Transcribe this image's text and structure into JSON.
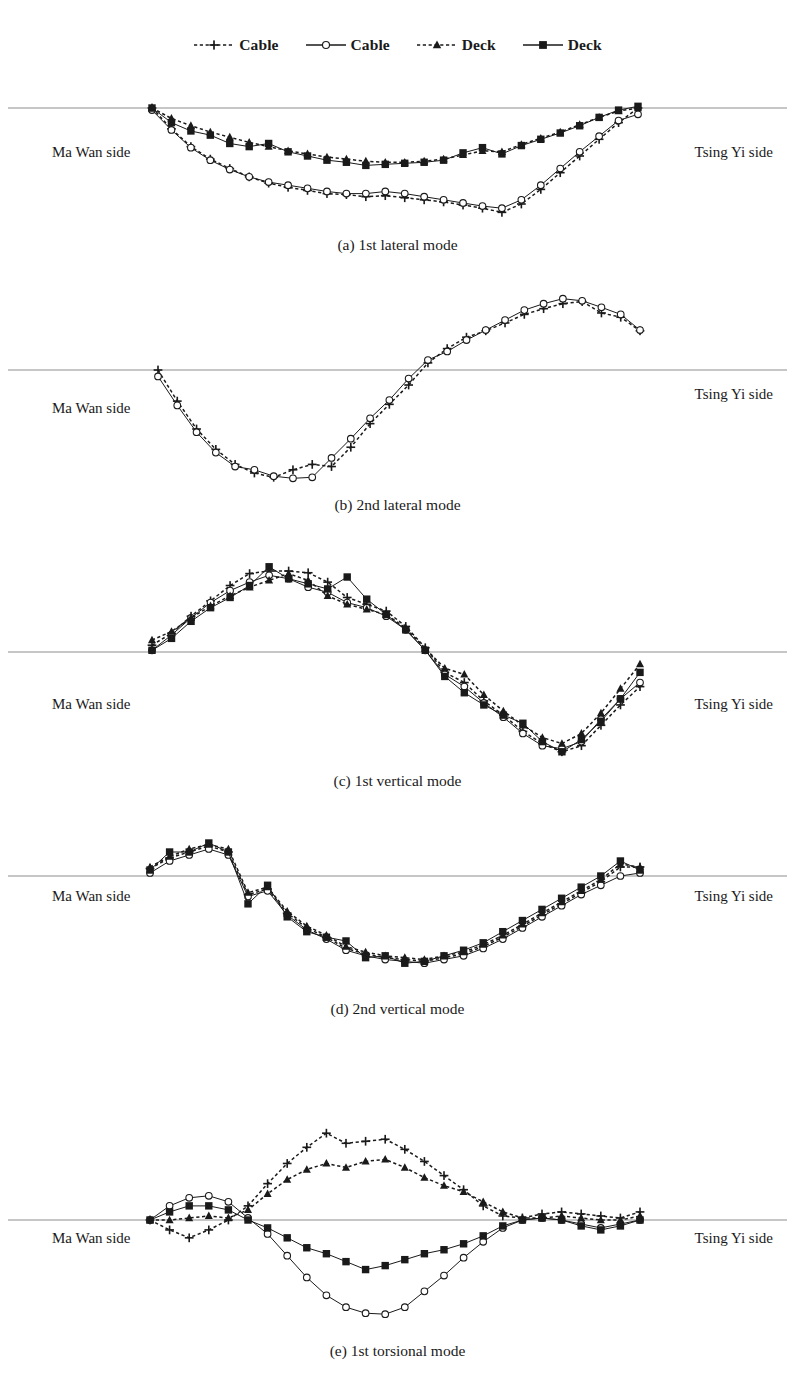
{
  "figure": {
    "side_label_left": "Ma Wan side",
    "side_label_right": "Tsing Yi side"
  },
  "legend": {
    "position": "top-center",
    "entries": [
      {
        "label": "Cable",
        "marker": "plus-icon",
        "line": "dotted",
        "color": "#1a1a1a"
      },
      {
        "label": "Cable",
        "marker": "circle-icon",
        "line": "solid",
        "color": "#1a1a1a"
      },
      {
        "label": "Deck",
        "marker": "triangle-icon",
        "line": "dotted",
        "color": "#1a1a1a"
      },
      {
        "label": "Deck",
        "marker": "square-icon",
        "line": "solid",
        "color": "#1a1a1a"
      }
    ]
  },
  "chart_data": [
    {
      "type": "line",
      "id": "a",
      "title": "(a) 1st lateral mode",
      "xlabel": "",
      "ylabel": "",
      "grid": false,
      "zero_axis": true,
      "xlim": [
        0,
        1
      ],
      "ylim": [
        -1.15,
        0.12
      ],
      "x": [
        0.0,
        0.04,
        0.08,
        0.12,
        0.16,
        0.2,
        0.24,
        0.28,
        0.32,
        0.36,
        0.4,
        0.44,
        0.48,
        0.52,
        0.56,
        0.6,
        0.64,
        0.68,
        0.72,
        0.76,
        0.8,
        0.84,
        0.88,
        0.92,
        0.96,
        1.0
      ],
      "series": [
        {
          "name": "Cable",
          "marker": "plus-icon",
          "line": "dotted",
          "values": [
            0.0,
            -0.2,
            -0.37,
            -0.49,
            -0.58,
            -0.66,
            -0.72,
            -0.76,
            -0.79,
            -0.82,
            -0.83,
            -0.85,
            -0.84,
            -0.86,
            -0.88,
            -0.9,
            -0.93,
            -0.96,
            -1.0,
            -0.92,
            -0.78,
            -0.62,
            -0.46,
            -0.3,
            -0.14,
            0.0
          ]
        },
        {
          "name": "Cable",
          "marker": "circle-icon",
          "line": "solid",
          "values": [
            -0.02,
            -0.21,
            -0.38,
            -0.5,
            -0.59,
            -0.66,
            -0.71,
            -0.74,
            -0.77,
            -0.8,
            -0.82,
            -0.82,
            -0.8,
            -0.82,
            -0.85,
            -0.88,
            -0.91,
            -0.94,
            -0.96,
            -0.88,
            -0.74,
            -0.58,
            -0.42,
            -0.27,
            -0.12,
            -0.06
          ]
        },
        {
          "name": "Deck",
          "marker": "triangle-icon",
          "line": "dotted",
          "values": [
            0.0,
            -0.1,
            -0.17,
            -0.23,
            -0.28,
            -0.33,
            -0.37,
            -0.41,
            -0.44,
            -0.47,
            -0.49,
            -0.51,
            -0.52,
            -0.52,
            -0.51,
            -0.49,
            -0.45,
            -0.41,
            -0.42,
            -0.35,
            -0.29,
            -0.23,
            -0.16,
            -0.09,
            -0.03,
            0.0
          ]
        },
        {
          "name": "Deck",
          "marker": "square-icon",
          "line": "solid",
          "values": [
            0.0,
            -0.14,
            -0.22,
            -0.26,
            -0.34,
            -0.37,
            -0.34,
            -0.42,
            -0.46,
            -0.5,
            -0.52,
            -0.55,
            -0.54,
            -0.53,
            -0.52,
            -0.5,
            -0.43,
            -0.38,
            -0.44,
            -0.36,
            -0.3,
            -0.24,
            -0.17,
            -0.09,
            -0.02,
            0.02
          ]
        }
      ]
    },
    {
      "type": "line",
      "id": "b",
      "title": "(b) 2nd lateral mode",
      "xlabel": "",
      "ylabel": "",
      "grid": false,
      "zero_axis": true,
      "xlim": [
        0,
        1
      ],
      "ylim": [
        -1.1,
        1.15
      ],
      "x": [
        0.0,
        0.04,
        0.08,
        0.12,
        0.16,
        0.2,
        0.24,
        0.28,
        0.32,
        0.36,
        0.4,
        0.44,
        0.48,
        0.52,
        0.56,
        0.6,
        0.64,
        0.68,
        0.72,
        0.76,
        0.8,
        0.84,
        0.88,
        0.92,
        0.96,
        1.0
      ],
      "series": [
        {
          "name": "Cable",
          "marker": "plus-icon",
          "line": "dotted",
          "values": [
            0.0,
            -0.29,
            -0.55,
            -0.74,
            -0.88,
            -0.96,
            -1.0,
            -0.93,
            -0.88,
            -0.9,
            -0.72,
            -0.5,
            -0.32,
            -0.14,
            0.1,
            0.3,
            0.46,
            0.55,
            0.66,
            0.78,
            0.86,
            0.93,
            0.96,
            0.8,
            0.74,
            0.55
          ]
        },
        {
          "name": "Cable",
          "marker": "circle-icon",
          "line": "solid",
          "values": [
            -0.06,
            -0.33,
            -0.58,
            -0.77,
            -0.9,
            -0.93,
            -0.99,
            -1.01,
            -1.0,
            -0.82,
            -0.64,
            -0.45,
            -0.28,
            -0.08,
            0.14,
            0.26,
            0.42,
            0.56,
            0.7,
            0.84,
            0.93,
            1.0,
            0.97,
            0.88,
            0.78,
            0.56
          ]
        }
      ]
    },
    {
      "type": "line",
      "id": "c",
      "title": "(c) 1st vertical mode",
      "xlabel": "",
      "ylabel": "",
      "grid": false,
      "zero_axis": true,
      "xlim": [
        0,
        1
      ],
      "ylim": [
        -1.1,
        1.15
      ],
      "x": [
        0.0,
        0.04,
        0.08,
        0.12,
        0.16,
        0.2,
        0.24,
        0.28,
        0.32,
        0.36,
        0.4,
        0.44,
        0.48,
        0.52,
        0.56,
        0.6,
        0.64,
        0.68,
        0.72,
        0.76,
        0.8,
        0.84,
        0.88,
        0.92,
        0.96,
        1.0
      ],
      "series": [
        {
          "name": "Cable",
          "marker": "plus-icon",
          "line": "dotted",
          "values": [
            0.08,
            0.22,
            0.42,
            0.6,
            0.78,
            0.92,
            0.95,
            0.95,
            0.93,
            0.82,
            0.64,
            0.56,
            0.48,
            0.3,
            0.05,
            -0.2,
            -0.3,
            -0.48,
            -0.62,
            -0.78,
            -0.9,
            -0.98,
            -0.92,
            -0.72,
            -0.52,
            -0.34
          ]
        },
        {
          "name": "Cable",
          "marker": "circle-icon",
          "line": "solid",
          "values": [
            0.02,
            0.2,
            0.4,
            0.58,
            0.72,
            0.82,
            0.9,
            0.86,
            0.76,
            0.7,
            0.58,
            0.52,
            0.42,
            0.26,
            0.02,
            -0.22,
            -0.34,
            -0.5,
            -0.64,
            -0.8,
            -0.92,
            -0.95,
            -0.88,
            -0.66,
            -0.46,
            -0.3
          ]
        },
        {
          "name": "Deck",
          "marker": "triangle-icon",
          "line": "dotted",
          "values": [
            0.14,
            0.24,
            0.4,
            0.54,
            0.66,
            0.76,
            0.84,
            0.92,
            0.84,
            0.66,
            0.56,
            0.5,
            0.44,
            0.28,
            0.04,
            -0.16,
            -0.22,
            -0.42,
            -0.58,
            -0.72,
            -0.84,
            -0.9,
            -0.8,
            -0.6,
            -0.36,
            -0.12
          ]
        },
        {
          "name": "Deck",
          "marker": "square-icon",
          "line": "solid",
          "values": [
            0.02,
            0.16,
            0.36,
            0.52,
            0.64,
            0.78,
            1.0,
            0.86,
            0.8,
            0.74,
            0.88,
            0.62,
            0.44,
            0.26,
            0.02,
            -0.24,
            -0.4,
            -0.52,
            -0.62,
            -0.7,
            -0.88,
            -0.98,
            -0.86,
            -0.68,
            -0.46,
            -0.2
          ]
        }
      ]
    },
    {
      "type": "line",
      "id": "d",
      "title": "(d) 2nd vertical mode",
      "xlabel": "",
      "ylabel": "",
      "grid": false,
      "zero_axis": true,
      "xlim": [
        0,
        1
      ],
      "ylim": [
        -1.25,
        0.28
      ],
      "x": [
        0.0,
        0.04,
        0.08,
        0.12,
        0.16,
        0.2,
        0.24,
        0.28,
        0.32,
        0.36,
        0.4,
        0.44,
        0.48,
        0.52,
        0.56,
        0.6,
        0.64,
        0.68,
        0.72,
        0.76,
        0.8,
        0.84,
        0.88,
        0.92,
        0.96,
        1.0
      ],
      "series": [
        {
          "name": "Cable",
          "marker": "plus-icon",
          "line": "dotted",
          "values": [
            0.05,
            0.12,
            0.16,
            0.2,
            0.16,
            -0.2,
            -0.14,
            -0.4,
            -0.56,
            -0.66,
            -0.78,
            -0.84,
            -0.88,
            -0.9,
            -0.92,
            -0.88,
            -0.84,
            -0.76,
            -0.66,
            -0.54,
            -0.42,
            -0.3,
            -0.18,
            -0.06,
            0.06,
            0.06
          ]
        },
        {
          "name": "Cable",
          "marker": "circle-icon",
          "line": "solid",
          "values": [
            0.02,
            0.1,
            0.14,
            0.18,
            0.14,
            -0.22,
            -0.16,
            -0.42,
            -0.58,
            -0.68,
            -0.8,
            -0.86,
            -0.9,
            -0.92,
            -0.94,
            -0.9,
            -0.86,
            -0.78,
            -0.68,
            -0.56,
            -0.44,
            -0.32,
            -0.2,
            -0.1,
            0.0,
            0.02
          ]
        },
        {
          "name": "Deck",
          "marker": "triangle-icon",
          "line": "dotted",
          "values": [
            0.06,
            0.13,
            0.18,
            0.21,
            0.18,
            -0.18,
            -0.12,
            -0.38,
            -0.54,
            -0.64,
            -0.76,
            -0.82,
            -0.86,
            -0.88,
            -0.9,
            -0.86,
            -0.82,
            -0.74,
            -0.64,
            -0.52,
            -0.4,
            -0.28,
            -0.16,
            -0.04,
            0.08,
            0.06
          ]
        },
        {
          "name": "Deck",
          "marker": "square-icon",
          "line": "solid",
          "values": [
            0.04,
            0.16,
            0.16,
            0.22,
            0.16,
            -0.3,
            -0.1,
            -0.44,
            -0.6,
            -0.66,
            -0.7,
            -0.88,
            -0.86,
            -0.94,
            -0.92,
            -0.86,
            -0.8,
            -0.72,
            -0.6,
            -0.48,
            -0.36,
            -0.24,
            -0.12,
            0.0,
            0.1,
            0.04
          ]
        }
      ]
    },
    {
      "type": "line",
      "id": "e",
      "title": "(e) 1st torsional mode",
      "xlabel": "",
      "ylabel": "",
      "grid": false,
      "zero_axis": true,
      "xlim": [
        0,
        1
      ],
      "ylim": [
        -1.15,
        1.05
      ],
      "x": [
        0.0,
        0.04,
        0.08,
        0.12,
        0.16,
        0.2,
        0.24,
        0.28,
        0.32,
        0.36,
        0.4,
        0.44,
        0.48,
        0.52,
        0.56,
        0.6,
        0.64,
        0.68,
        0.72,
        0.76,
        0.8,
        0.84,
        0.88,
        0.92,
        0.96,
        1.0
      ],
      "series": [
        {
          "name": "Cable",
          "marker": "plus-icon",
          "line": "dotted",
          "values": [
            0.0,
            -0.1,
            -0.18,
            -0.1,
            0.0,
            0.14,
            0.36,
            0.56,
            0.72,
            0.86,
            0.76,
            0.78,
            0.8,
            0.7,
            0.58,
            0.44,
            0.3,
            0.14,
            0.04,
            0.02,
            0.06,
            0.08,
            0.06,
            0.04,
            0.02,
            0.08
          ]
        },
        {
          "name": "Cable",
          "marker": "circle-icon",
          "line": "solid",
          "values": [
            0.0,
            0.14,
            0.22,
            0.24,
            0.18,
            0.02,
            -0.14,
            -0.36,
            -0.58,
            -0.76,
            -0.88,
            -0.94,
            -0.95,
            -0.88,
            -0.72,
            -0.56,
            -0.38,
            -0.22,
            -0.08,
            0.0,
            0.02,
            0.0,
            -0.04,
            -0.08,
            -0.04,
            0.0
          ]
        },
        {
          "name": "Deck",
          "marker": "triangle-icon",
          "line": "dotted",
          "values": [
            0.0,
            0.0,
            0.02,
            0.04,
            0.02,
            0.1,
            0.26,
            0.4,
            0.5,
            0.56,
            0.52,
            0.58,
            0.6,
            0.52,
            0.42,
            0.34,
            0.28,
            0.18,
            0.08,
            0.02,
            0.02,
            0.04,
            0.02,
            0.0,
            0.0,
            0.04
          ]
        },
        {
          "name": "Deck",
          "marker": "square-icon",
          "line": "solid",
          "values": [
            0.0,
            0.08,
            0.14,
            0.14,
            0.1,
            0.0,
            -0.08,
            -0.18,
            -0.28,
            -0.34,
            -0.42,
            -0.5,
            -0.46,
            -0.4,
            -0.34,
            -0.3,
            -0.24,
            -0.16,
            -0.06,
            0.0,
            0.02,
            0.0,
            -0.06,
            -0.1,
            -0.06,
            0.0
          ]
        }
      ]
    }
  ]
}
